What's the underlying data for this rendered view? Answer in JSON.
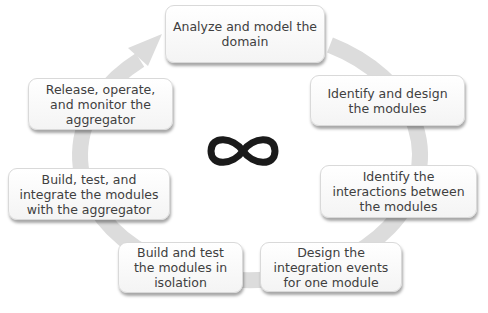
{
  "diagram": {
    "type": "cycle",
    "center_icon": "infinity-icon",
    "ring_color": "#d9d9d9",
    "steps": [
      {
        "label": "Analyze and model the domain"
      },
      {
        "label": "Identify and design the modules"
      },
      {
        "label": "Identify the interactions between the modules"
      },
      {
        "label": "Design the integration events for one module"
      },
      {
        "label": "Build and test the modules in isolation"
      },
      {
        "label": "Build, test, and integrate the modules with the aggregator"
      },
      {
        "label": "Release, operate, and monitor the aggregator"
      }
    ]
  }
}
